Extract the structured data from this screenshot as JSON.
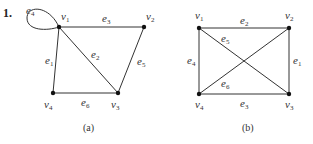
{
  "problem_number": "1.",
  "graphs": [
    {
      "caption": "(a)",
      "vertices": [
        {
          "id": "v1",
          "name": "v",
          "sub": "1",
          "x": 59,
          "y": 27,
          "lx": 61,
          "ly": 20
        },
        {
          "id": "v2",
          "name": "v",
          "sub": "2",
          "x": 144,
          "y": 27,
          "lx": 146,
          "ly": 20
        },
        {
          "id": "v3",
          "name": "v",
          "sub": "3",
          "x": 118,
          "y": 93,
          "lx": 111,
          "ly": 108
        },
        {
          "id": "v4",
          "name": "v",
          "sub": "4",
          "x": 53,
          "y": 93,
          "lx": 44,
          "ly": 108
        }
      ],
      "edges": [
        {
          "id": "e1",
          "name": "e",
          "sub": "1",
          "from": "v4",
          "to": "v1",
          "lx": 45,
          "ly": 64
        },
        {
          "id": "e2",
          "name": "e",
          "sub": "2",
          "from": "v1",
          "to": "v3",
          "lx": 91,
          "ly": 58
        },
        {
          "id": "e3",
          "name": "e",
          "sub": "3",
          "from": "v1",
          "to": "v2",
          "lx": 102,
          "ly": 22
        },
        {
          "id": "e4",
          "name": "e",
          "sub": "4",
          "loop": "v1",
          "lx": 26,
          "ly": 14
        },
        {
          "id": "e5",
          "name": "e",
          "sub": "5",
          "from": "v2",
          "to": "v3",
          "lx": 137,
          "ly": 65
        },
        {
          "id": "e6",
          "name": "e",
          "sub": "6",
          "from": "v4",
          "to": "v3",
          "lx": 81,
          "ly": 106
        }
      ],
      "caption_x": 83,
      "caption_y": 131
    },
    {
      "caption": "(b)",
      "vertices": [
        {
          "id": "v1",
          "name": "v",
          "sub": "1",
          "x": 199,
          "y": 28,
          "lx": 195,
          "ly": 19
        },
        {
          "id": "v2",
          "name": "v",
          "sub": "2",
          "x": 289,
          "y": 28,
          "lx": 285,
          "ly": 19
        },
        {
          "id": "v3",
          "name": "v",
          "sub": "3",
          "x": 289,
          "y": 94,
          "lx": 285,
          "ly": 108
        },
        {
          "id": "v4",
          "name": "v",
          "sub": "4",
          "x": 199,
          "y": 94,
          "lx": 195,
          "ly": 108
        }
      ],
      "edges": [
        {
          "id": "e1",
          "name": "e",
          "sub": "1",
          "from": "v2",
          "to": "v3",
          "lx": 293,
          "ly": 64
        },
        {
          "id": "e2",
          "name": "e",
          "sub": "2",
          "from": "v1",
          "to": "v2",
          "lx": 240,
          "ly": 24
        },
        {
          "id": "e3",
          "name": "e",
          "sub": "3",
          "from": "v4",
          "to": "v3",
          "lx": 240,
          "ly": 107
        },
        {
          "id": "e4",
          "name": "e",
          "sub": "4",
          "from": "v1",
          "to": "v4",
          "lx": 187,
          "ly": 64
        },
        {
          "id": "e5",
          "name": "e",
          "sub": "5",
          "from": "v1",
          "to": "v3",
          "lx": 221,
          "ly": 42
        },
        {
          "id": "e6",
          "name": "e",
          "sub": "6",
          "from": "v4",
          "to": "v2",
          "lx": 221,
          "ly": 87
        }
      ],
      "caption_x": 242,
      "caption_y": 131
    }
  ]
}
